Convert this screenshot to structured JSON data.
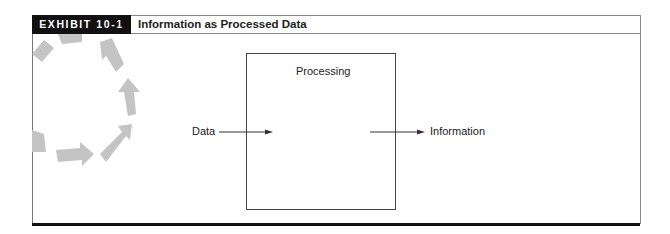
{
  "exhibit": {
    "label": "EXHIBIT 10-1",
    "title": "Information as Processed Data"
  },
  "diagram": {
    "input_label": "Data",
    "process_label": "Processing",
    "output_label": "Information"
  },
  "colors": {
    "header_bg": "#111111",
    "header_text": "#ffffff",
    "decoration": "#bdbdbd",
    "line": "#444444"
  },
  "decoration_icon": "circular-arrows-icon"
}
